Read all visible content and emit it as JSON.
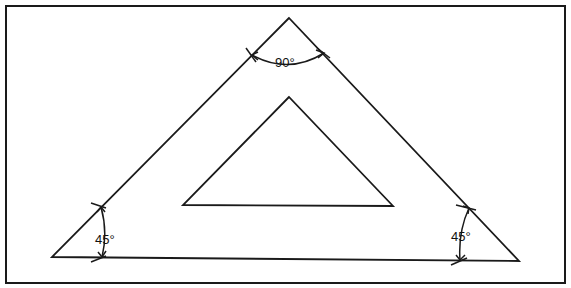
{
  "diagram": {
    "stroke_color": "#1a1a1a",
    "background": "#ffffff",
    "frame": {
      "x1": 6,
      "y1": 6,
      "x2": 565,
      "y2": 283
    },
    "outer_triangle": {
      "apex": [
        289,
        18
      ],
      "left": [
        52,
        257
      ],
      "right": [
        519,
        261
      ]
    },
    "inner_triangle": {
      "apex": [
        289,
        97
      ],
      "left": [
        183,
        205
      ],
      "right": [
        393,
        206
      ]
    },
    "angles": [
      {
        "id": "top",
        "label": "90°",
        "x": 287,
        "y": 66
      },
      {
        "id": "left",
        "label": "45°",
        "x": 103,
        "y": 244
      },
      {
        "id": "right",
        "label": "45°",
        "x": 460,
        "y": 241
      }
    ]
  }
}
